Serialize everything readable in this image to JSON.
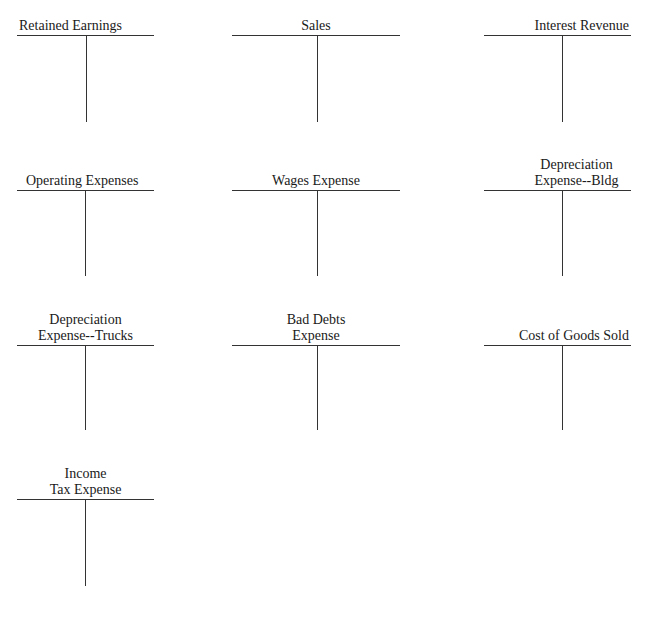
{
  "accounts": [
    {
      "lines": [
        "",
        "Retained Earnings"
      ],
      "align": "left"
    },
    {
      "lines": [
        "",
        "Sales"
      ],
      "align": "center"
    },
    {
      "lines": [
        "",
        "Interest Revenue"
      ],
      "align": "right"
    },
    {
      "lines": [
        "",
        "Operating Expenses"
      ],
      "align": "left"
    },
    {
      "lines": [
        "",
        "Wages Expense"
      ],
      "align": "center"
    },
    {
      "lines": [
        "Depreciation",
        "Expense--Bldg"
      ],
      "align": "right"
    },
    {
      "lines": [
        "Depreciation",
        "Expense--Trucks"
      ],
      "align": "center"
    },
    {
      "lines": [
        "Bad Debts",
        "Expense"
      ],
      "align": "center"
    },
    {
      "lines": [
        "",
        "Cost of Goods Sold"
      ],
      "align": "right"
    },
    {
      "lines": [
        "Income",
        "Tax Expense"
      ],
      "align": "center"
    }
  ]
}
